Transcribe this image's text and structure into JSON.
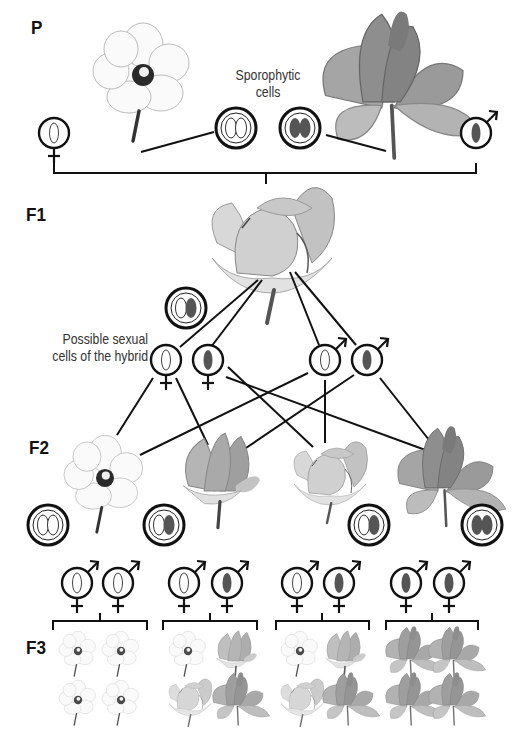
{
  "generations": {
    "p": "P",
    "f1": "F1",
    "f2": "F2",
    "f3": "F3"
  },
  "captions": {
    "sporophytic_line1": "Sporophytic",
    "sporophytic_line2": "cells",
    "sexual_line1": "Possible sexual",
    "sexual_line2": "cells of the hybrid"
  },
  "colors": {
    "line": "#111111",
    "dark_allele": "#555555",
    "light_allele": "#ffffff",
    "white_flower": "#f7f7f7",
    "light_petal": "#d6d6d6",
    "mid_petal": "#a8a8a8",
    "dark_petal": "#8a8a8a"
  },
  "parents": [
    {
      "flower": "white",
      "cell": "light-light",
      "gamete": "light",
      "sex": "female"
    },
    {
      "flower": "dark",
      "cell": "dark-dark",
      "gamete": "dark",
      "sex": "male"
    }
  ],
  "f1": {
    "flower": "hybrid-pink",
    "cell": "light-dark"
  },
  "gametes": [
    {
      "allele": "light",
      "sex": "female"
    },
    {
      "allele": "dark",
      "sex": "female"
    },
    {
      "allele": "light",
      "sex": "male"
    },
    {
      "allele": "dark",
      "sex": "male"
    }
  ],
  "f2": [
    {
      "flower": "white",
      "cell": "light-light"
    },
    {
      "flower": "mid",
      "cell": "light-dark"
    },
    {
      "flower": "hybrid",
      "cell": "light-dark"
    },
    {
      "flower": "dark",
      "cell": "dark-dark"
    }
  ],
  "f3_groups": [
    {
      "gametes": [
        "light",
        "light"
      ],
      "offspring": [
        "white",
        "white",
        "white",
        "white"
      ]
    },
    {
      "gametes": [
        "light",
        "dark"
      ],
      "offspring": [
        "white",
        "mid",
        "hybrid",
        "dark"
      ]
    },
    {
      "gametes": [
        "light",
        "dark"
      ],
      "offspring": [
        "white",
        "mid",
        "hybrid",
        "dark"
      ]
    },
    {
      "gametes": [
        "dark",
        "dark"
      ],
      "offspring": [
        "dark",
        "dark",
        "dark",
        "dark"
      ]
    }
  ]
}
